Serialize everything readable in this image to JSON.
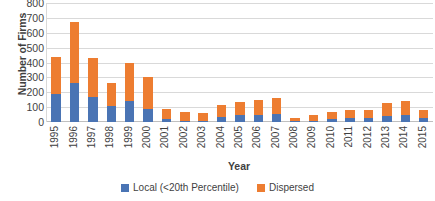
{
  "chart_data": {
    "type": "bar",
    "stacked": true,
    "title": "",
    "xlabel": "Year",
    "ylabel": "Number of Firms",
    "ylim": [
      0,
      800
    ],
    "ytick_step": 100,
    "yticks": [
      "0",
      "100",
      "200",
      "300",
      "400",
      "500",
      "600",
      "700",
      "800"
    ],
    "grid": true,
    "legend_position": "bottom",
    "categories": [
      "1995",
      "1996",
      "1997",
      "1998",
      "1999",
      "2000",
      "2001",
      "2002",
      "2003",
      "2004",
      "2005",
      "2006",
      "2007",
      "2008",
      "2009",
      "2010",
      "2011",
      "2012",
      "2013",
      "2014",
      "2015"
    ],
    "series": [
      {
        "name": "Local (<20th Percentile)",
        "color": "#4a74b4",
        "values": [
          185,
          265,
          165,
          105,
          140,
          85,
          20,
          10,
          10,
          35,
          45,
          50,
          55,
          5,
          10,
          20,
          25,
          25,
          40,
          50,
          25
        ]
      },
      {
        "name": "Dispersed",
        "color": "#ed7d31",
        "values": [
          250,
          405,
          265,
          160,
          255,
          215,
          65,
          55,
          50,
          80,
          90,
          95,
          105,
          25,
          40,
          50,
          55,
          55,
          85,
          90,
          55
        ]
      }
    ],
    "totals": [
      435,
      670,
      430,
      265,
      395,
      300,
      85,
      65,
      60,
      115,
      135,
      145,
      160,
      30,
      50,
      70,
      80,
      80,
      125,
      140,
      80
    ]
  },
  "colors": {
    "local": "#4a74b4",
    "dispersed": "#ed7d31",
    "gridline": "#d9d9d9",
    "text": "#3f3f3f",
    "background": "#ffffff"
  }
}
